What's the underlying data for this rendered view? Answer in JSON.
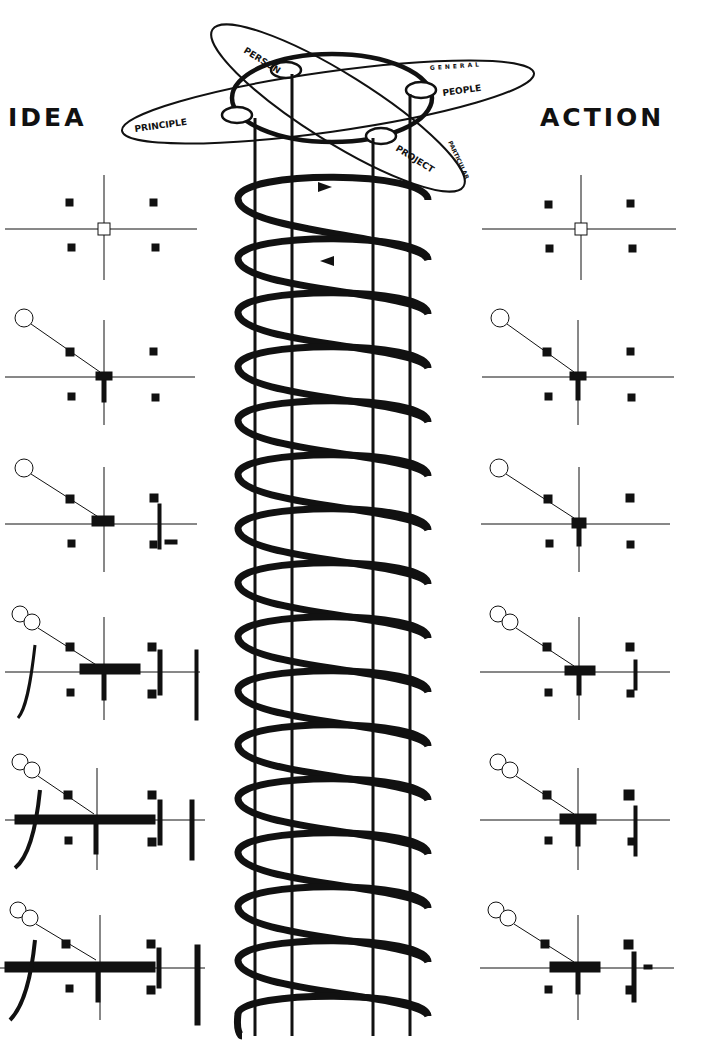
{
  "headings": {
    "left": "IDEA",
    "right": "ACTION"
  },
  "orbit": {
    "nodes": [
      "PERSON",
      "PEOPLE",
      "PRINCIPLE",
      "PROJECT"
    ],
    "axis_labels": [
      "GENERAL",
      "PARTICULAR"
    ]
  },
  "helix": {
    "loops": 16,
    "arrows": [
      "clockwise-top",
      "counter-return"
    ]
  },
  "columns": {
    "left": {
      "label": "IDEA",
      "panels": 6
    },
    "right": {
      "label": "ACTION",
      "panels": 6
    }
  },
  "colors": {
    "ink": "#111111",
    "paper": "#ffffff"
  }
}
